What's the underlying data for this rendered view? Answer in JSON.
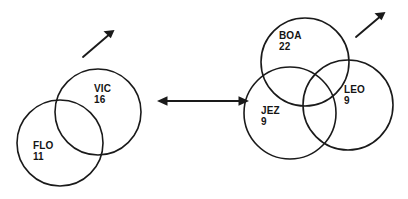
{
  "diagram": {
    "type": "set-relationship-diagram",
    "background_color": "#ffffff",
    "stroke_color": "#1a1a1a",
    "text_color": "#141414",
    "connector": {
      "name": "double-headed-arrow",
      "glyph": "↔",
      "direction": "bidirectional"
    },
    "groups": [
      {
        "id": "left-group",
        "name": "two-set-venn",
        "circle_count": 2,
        "pointer": {
          "name": "up-right-arrow",
          "glyph": "↗",
          "direction": "up-right"
        },
        "sets": [
          {
            "id": "vic",
            "label": "VIC",
            "count": "16",
            "cx": 98,
            "cy": 112,
            "r": 43
          },
          {
            "id": "flo",
            "label": "FLO",
            "count": "11",
            "cx": 60,
            "cy": 143,
            "r": 43
          }
        ]
      },
      {
        "id": "right-group",
        "name": "three-set-venn",
        "circle_count": 3,
        "pointer": {
          "name": "up-right-arrow",
          "glyph": "↗",
          "direction": "up-right"
        },
        "sets": [
          {
            "id": "boa",
            "label": "BOA",
            "count": "22",
            "cx": 305,
            "cy": 62,
            "r": 44
          },
          {
            "id": "leo",
            "label": "LEO",
            "count": "9",
            "cx": 348,
            "cy": 105,
            "r": 45
          },
          {
            "id": "jez",
            "label": "JEZ",
            "count": "9",
            "cx": 290,
            "cy": 113,
            "r": 46
          }
        ]
      }
    ]
  }
}
